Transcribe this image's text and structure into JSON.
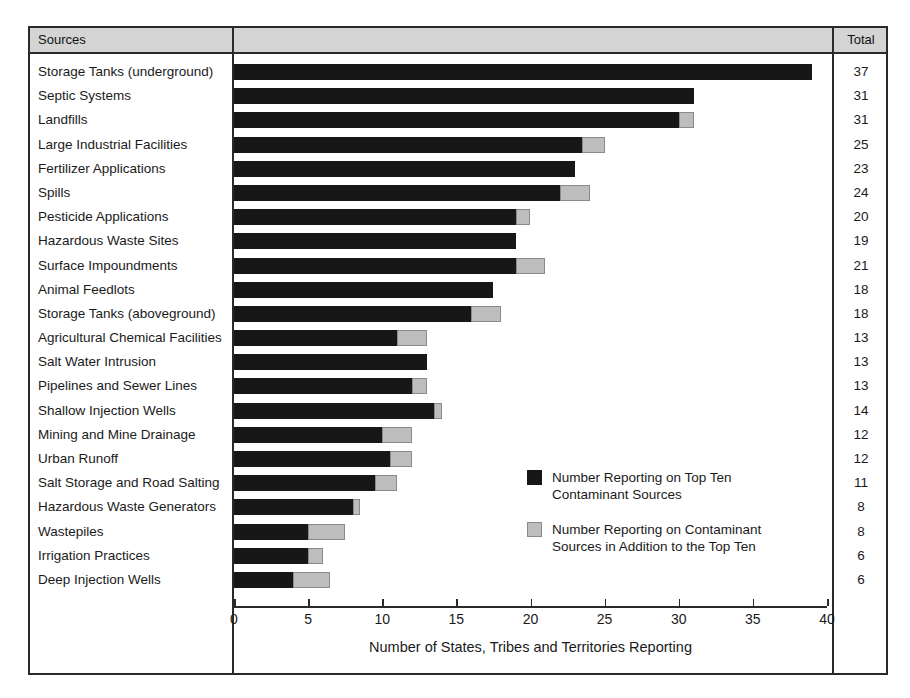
{
  "figure": {
    "column_headers": {
      "sources": "Sources",
      "total": "Total"
    }
  },
  "chart_data": {
    "type": "bar",
    "orientation": "horizontal",
    "stacked": true,
    "title": "",
    "xlabel": "Number of States, Tribes and Territories Reporting",
    "ylabel": "Sources",
    "xlim": [
      0,
      40
    ],
    "xticks": [
      0,
      5,
      10,
      15,
      20,
      25,
      30,
      35,
      40
    ],
    "xtick_labels": [
      "0",
      "5",
      "10",
      "15",
      "20",
      "25",
      "30",
      "35",
      "40"
    ],
    "grid": false,
    "legend_position": "inside-right",
    "colors": {
      "top_ten": "#171717",
      "additional": "#bdbdbd"
    },
    "legend": [
      "Number Reporting on Top Ten Contaminant Sources",
      "Number Reporting on Contaminant Sources in Addition to the Top Ten"
    ],
    "legend_lines": [
      [
        "Number Reporting on Top Ten",
        "Contaminant Sources"
      ],
      [
        "Number Reporting on Contaminant",
        "Sources in Addition to the Top Ten"
      ]
    ],
    "categories": [
      "Storage Tanks (underground)",
      "Septic Systems",
      "Landfills",
      "Large Industrial Facilities",
      "Fertilizer Applications",
      "Spills",
      "Pesticide Applications",
      "Hazardous Waste Sites",
      "Surface Impoundments",
      "Animal Feedlots",
      "Storage Tanks (aboveground)",
      "Agricultural Chemical Facilities",
      "Salt Water Intrusion",
      "Pipelines and Sewer Lines",
      "Shallow Injection Wells",
      "Mining and Mine Drainage",
      "Urban Runoff",
      "Salt Storage and Road Salting",
      "Hazardous Waste Generators",
      "Wastepiles",
      "Irrigation Practices",
      "Deep Injection Wells"
    ],
    "series": [
      {
        "name": "Number Reporting on Top Ten Contaminant Sources",
        "values": [
          39,
          31,
          30,
          23.5,
          23,
          22,
          19,
          19,
          19,
          17.5,
          16,
          11,
          13,
          12,
          13.5,
          10,
          10.5,
          9.5,
          8,
          5,
          5,
          4
        ]
      },
      {
        "name": "Number Reporting on Contaminant Sources in Addition to the Top Ten",
        "values": [
          0,
          0,
          1,
          1.5,
          0,
          2,
          1,
          0,
          2,
          0,
          2,
          2,
          0,
          1,
          0.5,
          2,
          1.5,
          1.5,
          0.5,
          2.5,
          1,
          2.5
        ]
      }
    ],
    "totals": [
      37,
      31,
      31,
      25,
      23,
      24,
      20,
      19,
      21,
      18,
      18,
      13,
      13,
      13,
      14,
      12,
      12,
      11,
      8,
      8,
      6,
      6
    ]
  }
}
